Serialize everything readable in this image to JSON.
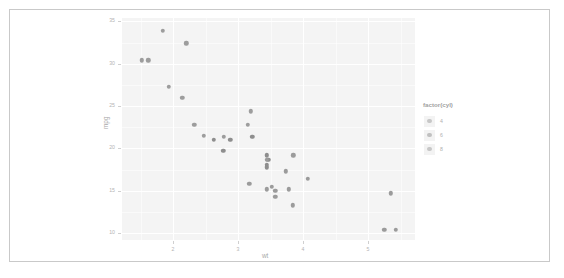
{
  "chart_data": {
    "type": "scatter",
    "title": "",
    "xlabel": "wt",
    "ylabel": "mpg",
    "xlim": [
      1.21,
      5.72
    ],
    "ylim": [
      9.2,
      35.4
    ],
    "xticks": [
      2,
      3,
      4,
      5
    ],
    "xtick_labels": [
      "2",
      "3",
      "4",
      "5"
    ],
    "yticks": [
      10,
      15,
      20,
      25,
      30,
      35
    ],
    "ytick_labels": [
      "10",
      "15",
      "20",
      "25",
      "30",
      "35"
    ],
    "x_minor_ticks": [
      1.5,
      2.5,
      3.5,
      4.5,
      5.5
    ],
    "y_minor_ticks": [
      12.5,
      17.5,
      22.5,
      27.5,
      32.5
    ],
    "grid": true,
    "legend": {
      "title": "factor(cyl)",
      "position": "right",
      "entries": [
        {
          "label": "4",
          "color": "#9a9a9a"
        },
        {
          "label": "6",
          "color": "#8e8e8e"
        },
        {
          "label": "8",
          "color": "#9a9a9a"
        }
      ]
    },
    "colors": {
      "panel_background": "#ebebeb",
      "gridline": "#ffffff",
      "point_4cyl": "#9d9d9d",
      "point_6cyl": "#8e8e8e",
      "point_8cyl": "#9b9b9b",
      "axis_text": "#b4b4b4",
      "frame_border": "#c9c9c9"
    },
    "series": [
      {
        "name": "4",
        "color": "#9d9d9d",
        "points": [
          {
            "x": 2.32,
            "y": 22.8
          },
          {
            "x": 3.19,
            "y": 24.4
          },
          {
            "x": 3.15,
            "y": 22.8
          },
          {
            "x": 2.2,
            "y": 32.4
          },
          {
            "x": 1.615,
            "y": 30.4
          },
          {
            "x": 1.835,
            "y": 33.9
          },
          {
            "x": 2.465,
            "y": 21.5
          },
          {
            "x": 1.935,
            "y": 27.3
          },
          {
            "x": 2.14,
            "y": 26.0
          },
          {
            "x": 1.513,
            "y": 30.4
          },
          {
            "x": 2.78,
            "y": 21.4
          }
        ]
      },
      {
        "name": "6",
        "color": "#8e8e8e",
        "points": [
          {
            "x": 2.62,
            "y": 21.0
          },
          {
            "x": 2.875,
            "y": 21.0
          },
          {
            "x": 3.215,
            "y": 21.4
          },
          {
            "x": 3.44,
            "y": 18.1
          },
          {
            "x": 3.46,
            "y": 18.7
          },
          {
            "x": 3.44,
            "y": 19.2
          },
          {
            "x": 3.44,
            "y": 17.8
          },
          {
            "x": 2.77,
            "y": 19.7
          }
        ]
      },
      {
        "name": "8",
        "color": "#9b9b9b",
        "points": [
          {
            "x": 3.44,
            "y": 18.7
          },
          {
            "x": 3.57,
            "y": 14.3
          },
          {
            "x": 4.07,
            "y": 16.4
          },
          {
            "x": 3.73,
            "y": 17.3
          },
          {
            "x": 3.78,
            "y": 15.2
          },
          {
            "x": 5.25,
            "y": 10.4
          },
          {
            "x": 5.424,
            "y": 10.4
          },
          {
            "x": 5.345,
            "y": 14.7
          },
          {
            "x": 3.52,
            "y": 15.5
          },
          {
            "x": 3.435,
            "y": 15.2
          },
          {
            "x": 3.84,
            "y": 13.3
          },
          {
            "x": 3.845,
            "y": 19.2
          },
          {
            "x": 3.17,
            "y": 15.8
          },
          {
            "x": 3.57,
            "y": 15.0
          }
        ]
      }
    ]
  }
}
